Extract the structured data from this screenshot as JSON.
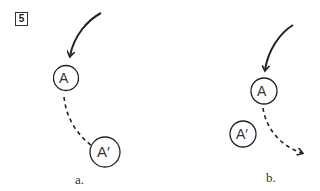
{
  "figure": {
    "number": "5",
    "panels": [
      {
        "label": "a.",
        "start_node": "A",
        "end_node": "A′",
        "description": "Solid curved arrow into A; dashed path continuing to A′ below-right"
      },
      {
        "label": "b.",
        "start_node": "A",
        "end_node": "A′",
        "description": "Solid curved arrow into A; dashed arrow curving away to the right, with A′ placed below-left"
      }
    ]
  },
  "colors": {
    "ink": "#222222",
    "background": "#ffffff"
  }
}
